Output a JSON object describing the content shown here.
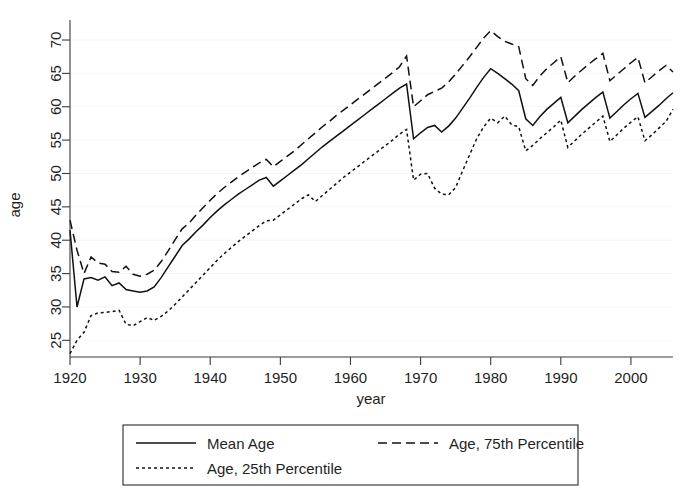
{
  "chart_data": {
    "type": "line",
    "title": "",
    "subtitle": "",
    "xlabel": "year",
    "ylabel": "age",
    "xlim": [
      1920,
      2006
    ],
    "ylim": [
      22.5,
      73
    ],
    "grid": true,
    "grid_style": "faint horizontal gridlines",
    "legend_position": "below plot, boxed, two columns",
    "xticks": [
      1920,
      1930,
      1940,
      1950,
      1960,
      1970,
      1980,
      1990,
      2000
    ],
    "xtick_labels": [
      "1920",
      "1930",
      "1940",
      "1950",
      "1960",
      "1970",
      "1980",
      "1990",
      "2000"
    ],
    "yticks": [
      25,
      30,
      35,
      40,
      45,
      50,
      55,
      60,
      65,
      70
    ],
    "ytick_labels": [
      "25",
      "30",
      "35",
      "40",
      "45",
      "50",
      "55",
      "60",
      "65",
      "70"
    ],
    "x": [
      1920,
      1921,
      1922,
      1923,
      1924,
      1925,
      1926,
      1927,
      1928,
      1929,
      1930,
      1931,
      1932,
      1933,
      1934,
      1935,
      1936,
      1937,
      1938,
      1939,
      1940,
      1941,
      1942,
      1943,
      1944,
      1945,
      1946,
      1947,
      1948,
      1949,
      1950,
      1951,
      1952,
      1953,
      1954,
      1955,
      1956,
      1957,
      1958,
      1959,
      1960,
      1961,
      1962,
      1963,
      1964,
      1965,
      1966,
      1967,
      1968,
      1969,
      1970,
      1971,
      1972,
      1973,
      1974,
      1975,
      1976,
      1977,
      1978,
      1979,
      1980,
      1981,
      1982,
      1983,
      1984,
      1985,
      1986,
      1987,
      1988,
      1989,
      1990,
      1991,
      1992,
      1993,
      1994,
      1995,
      1996,
      1997,
      1998,
      1999,
      2000,
      2001,
      2002,
      2003,
      2004,
      2005,
      2006
    ],
    "series": [
      {
        "name": "Mean Age",
        "line_style": "solid",
        "values": [
          41.5,
          30.0,
          34.2,
          34.4,
          34.0,
          34.5,
          33.2,
          33.6,
          32.6,
          32.4,
          32.2,
          32.4,
          33.0,
          34.4,
          36.0,
          37.6,
          39.2,
          40.2,
          41.3,
          42.3,
          43.4,
          44.4,
          45.3,
          46.1,
          46.9,
          47.6,
          48.3,
          49.0,
          49.4,
          48.1,
          48.9,
          49.7,
          50.5,
          51.3,
          52.2,
          53.1,
          54.0,
          54.8,
          55.6,
          56.4,
          57.2,
          58.0,
          58.8,
          59.6,
          60.4,
          61.2,
          62.0,
          62.8,
          63.4,
          55.2,
          56.1,
          56.9,
          57.2,
          56.2,
          57.1,
          58.3,
          59.8,
          61.3,
          62.9,
          64.4,
          65.7,
          65.0,
          64.2,
          63.4,
          62.4,
          58.2,
          57.2,
          58.5,
          59.6,
          60.5,
          61.4,
          57.6,
          58.6,
          59.6,
          60.5,
          61.4,
          62.2,
          58.3,
          59.3,
          60.3,
          61.2,
          62.0,
          58.4,
          59.3,
          60.2,
          61.2,
          62.1
        ]
      },
      {
        "name": "Age, 75th Percentile",
        "line_style": "dashed",
        "values": [
          43.0,
          38.5,
          35.0,
          37.5,
          36.6,
          36.4,
          35.3,
          35.2,
          36.1,
          34.9,
          34.6,
          34.9,
          35.5,
          36.8,
          38.4,
          40.1,
          41.7,
          42.6,
          43.8,
          44.9,
          46.0,
          47.0,
          47.9,
          48.7,
          49.5,
          50.2,
          50.9,
          51.6,
          52.1,
          51.0,
          51.8,
          52.6,
          53.4,
          54.3,
          55.2,
          56.1,
          57.0,
          57.8,
          58.7,
          59.5,
          60.3,
          61.1,
          61.9,
          62.7,
          63.5,
          64.3,
          65.1,
          66.0,
          67.6,
          60.0,
          60.9,
          61.8,
          62.3,
          62.8,
          63.7,
          64.9,
          66.2,
          67.5,
          68.9,
          70.3,
          71.4,
          70.5,
          69.8,
          69.4,
          69.0,
          64.2,
          63.2,
          64.6,
          65.7,
          66.6,
          67.5,
          63.6,
          64.6,
          65.5,
          66.4,
          67.2,
          68.0,
          63.9,
          64.8,
          65.7,
          66.6,
          67.4,
          63.6,
          64.5,
          65.4,
          66.2,
          65.2
        ]
      },
      {
        "name": "Age, 25th Percentile",
        "line_style": "dotted",
        "values": [
          23.0,
          25.0,
          26.2,
          28.7,
          29.1,
          29.2,
          29.3,
          29.5,
          27.4,
          27.2,
          27.8,
          28.4,
          28.0,
          28.6,
          29.4,
          30.4,
          31.5,
          32.6,
          33.7,
          34.8,
          35.9,
          37.0,
          38.0,
          38.9,
          39.8,
          40.6,
          41.4,
          42.2,
          42.9,
          43.0,
          43.8,
          44.6,
          45.4,
          46.2,
          46.8,
          45.8,
          46.7,
          47.6,
          48.5,
          49.4,
          50.2,
          51.0,
          51.8,
          52.6,
          53.4,
          54.2,
          55.0,
          55.9,
          56.6,
          49.0,
          49.9,
          50.0,
          47.8,
          46.9,
          46.8,
          47.9,
          50.4,
          52.8,
          55.2,
          57.0,
          58.3,
          57.6,
          58.6,
          57.3,
          57.0,
          53.4,
          54.2,
          55.2,
          56.1,
          57.0,
          58.0,
          53.9,
          54.9,
          55.9,
          56.8,
          57.7,
          58.6,
          54.8,
          55.8,
          56.8,
          57.7,
          58.5,
          54.9,
          55.8,
          56.8,
          57.8,
          59.6
        ]
      }
    ],
    "legend": [
      {
        "label": "Mean Age",
        "style": "solid"
      },
      {
        "label": "Age, 75th Percentile",
        "style": "dashed"
      },
      {
        "label": "Age, 25th Percentile",
        "style": "dotted"
      }
    ]
  }
}
